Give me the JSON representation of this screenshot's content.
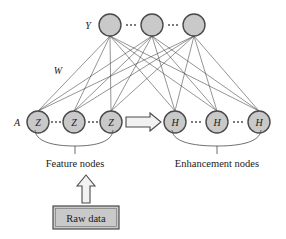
{
  "diagram": {
    "background_color": "#ffffff",
    "node_fill_color": "#c9c9c9",
    "node_stroke_color": "#4a4a4a",
    "edge_color": "#3d3d3d",
    "layers": {
      "output": {
        "label": "Y",
        "label_x": 88,
        "label_y": 25,
        "node_label": "Y",
        "y": 25,
        "radius": 11,
        "nodes": [
          {
            "label": "",
            "x": 110,
            "y": 25
          },
          {
            "label": "",
            "x": 152,
            "y": 25
          },
          {
            "label": "",
            "x": 194,
            "y": 25
          }
        ],
        "ellipses": [
          {
            "x": 131,
            "y": 25
          },
          {
            "x": 173,
            "y": 25
          }
        ]
      },
      "feature": {
        "label": "A",
        "label_x": 17,
        "label_y": 122,
        "node_label": "Z",
        "y": 122,
        "radius": 11,
        "group_label": "Feature nodes",
        "group_label_x": 75,
        "group_label_y": 163,
        "nodes": [
          {
            "label": "Z",
            "x": 38,
            "y": 122
          },
          {
            "label": "Z",
            "x": 74,
            "y": 122
          },
          {
            "label": "Z",
            "x": 111,
            "y": 122
          }
        ],
        "ellipses": [
          {
            "x": 56,
            "y": 122
          },
          {
            "x": 93,
            "y": 122
          }
        ]
      },
      "enhancement": {
        "node_label": "H",
        "y": 122,
        "radius": 11,
        "group_label": "Enhancement nodes",
        "group_label_x": 217,
        "group_label_y": 163,
        "nodes": [
          {
            "label": "H",
            "x": 175,
            "y": 122
          },
          {
            "label": "H",
            "x": 217,
            "y": 122
          },
          {
            "label": "H",
            "x": 259,
            "y": 122
          }
        ],
        "ellipses": [
          {
            "x": 196,
            "y": 122
          },
          {
            "x": 238,
            "y": 122
          }
        ]
      }
    },
    "weight_label": {
      "text": "W",
      "x": 58,
      "y": 70
    },
    "mapping_arrow": {
      "name": "feature-to-enhancement-arrow",
      "direction": "right",
      "x1": 126,
      "x2": 160,
      "y": 122
    },
    "input_arrow": {
      "name": "raw-data-to-feature-arrow",
      "direction": "up",
      "x": 86,
      "y1": 202,
      "y2": 176
    },
    "input_box": {
      "label": "Raw data",
      "x": 53,
      "y": 206,
      "width": 66,
      "height": 23
    }
  }
}
